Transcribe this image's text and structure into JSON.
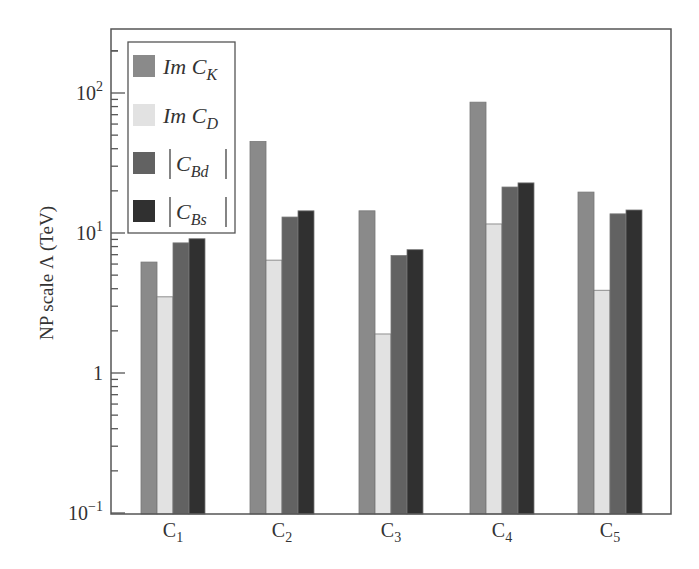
{
  "chart_data": {
    "type": "bar",
    "title": "",
    "xlabel": "",
    "ylabel": "NP scale Λ (TeV)",
    "yscale": "log",
    "ylim": [
      0.1,
      286
    ],
    "yticks": [
      {
        "value": 0.1,
        "base": "10",
        "exp": "−1"
      },
      {
        "value": 1,
        "base": "1",
        "exp": ""
      },
      {
        "value": 10,
        "base": "10",
        "exp": "1"
      },
      {
        "value": 100,
        "base": "10",
        "exp": "2"
      }
    ],
    "categories": [
      {
        "base": "C",
        "sub": "1"
      },
      {
        "base": "C",
        "sub": "2"
      },
      {
        "base": "C",
        "sub": "3"
      },
      {
        "base": "C",
        "sub": "4"
      },
      {
        "base": "C",
        "sub": "5"
      }
    ],
    "series": [
      {
        "name": "Im C_K",
        "legend_main": "Im C",
        "legend_sub": "K",
        "abs": false,
        "color": "#8a8a8a",
        "values": [
          6.2,
          45,
          14.4,
          86,
          19.6
        ]
      },
      {
        "name": "Im C_D",
        "legend_main": "Im C",
        "legend_sub": "D",
        "abs": false,
        "color": "#e2e2e2",
        "values": [
          3.5,
          6.4,
          1.9,
          11.6,
          3.9
        ]
      },
      {
        "name": "|C_Bd|",
        "legend_main": "C",
        "legend_sub": "Bd",
        "abs": true,
        "color": "#626262",
        "values": [
          8.5,
          13,
          6.9,
          21.3,
          13.7
        ]
      },
      {
        "name": "|C_Bs|",
        "legend_main": "C",
        "legend_sub": "Bs",
        "abs": true,
        "color": "#303030",
        "values": [
          9.1,
          14.4,
          7.6,
          22.8,
          14.6
        ]
      }
    ],
    "grid": false,
    "legend_position": "upper left"
  }
}
